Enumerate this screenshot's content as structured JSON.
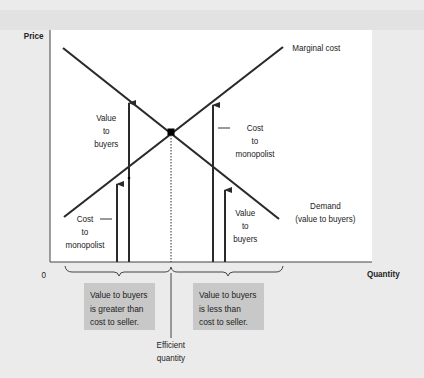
{
  "diagram": {
    "axes": {
      "y_label": "Price",
      "x_label": "Quantity",
      "origin_label": "0"
    },
    "curves": {
      "marginal_cost": "Marginal cost",
      "demand_line1": "Demand",
      "demand_line2": "(value to buyers)"
    },
    "left_labels": {
      "value_line1": "Value",
      "value_line2": "to",
      "value_line3": "buyers",
      "cost_line1": "Cost",
      "cost_line2": "to",
      "cost_line3": "monopolist"
    },
    "right_labels": {
      "cost_line1": "Cost",
      "cost_line2": "to",
      "cost_line3": "monopolist",
      "value_line1": "Value",
      "value_line2": "to",
      "value_line3": "buyers"
    },
    "boxes": {
      "left": [
        "Value to buyers",
        "is greater than",
        "cost to seller."
      ],
      "right": [
        "Value to buyers",
        "is less than",
        "cost to seller."
      ]
    },
    "efficient": {
      "line1": "Efficient",
      "line2": "quantity"
    },
    "colors": {
      "line": "#2a2a2a",
      "box": "#c8c8c8",
      "plot_bg": "#ffffff",
      "page_bg": "#ebebeb"
    }
  }
}
